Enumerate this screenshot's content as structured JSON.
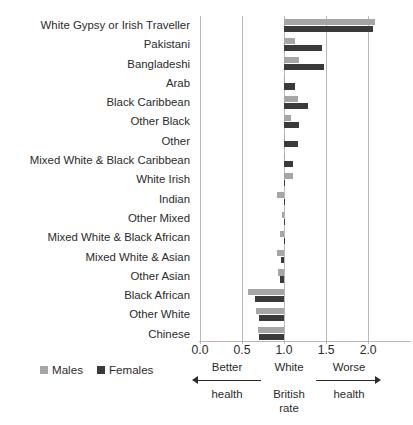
{
  "chart_data": {
    "type": "bar",
    "orientation": "horizontal",
    "title": "",
    "xlabel": "",
    "ylabel": "",
    "xlim": [
      0.0,
      2.2
    ],
    "baseline": 1.0,
    "grid": true,
    "legend_position": "bottom-left",
    "xticks": [
      "0.0",
      "0.5",
      "1.0",
      "1.5",
      "2.0"
    ],
    "xtick_values": [
      0.0,
      0.5,
      1.0,
      1.5,
      2.0
    ],
    "categories": [
      "White Gypsy or Irish Traveller",
      "Pakistani",
      "Bangladeshi",
      "Arab",
      "Black Caribbean",
      "Other Black",
      "Other",
      "Mixed White & Black Caribbean",
      "White Irish",
      "Indian",
      "Other Mixed",
      "Mixed White & Black African",
      "Mixed White & Asian",
      "Other Asian",
      "Black African",
      "Other White",
      "Chinese"
    ],
    "series": [
      {
        "name": "Males",
        "color": "#a6a6a6",
        "values": [
          2.08,
          1.13,
          1.18,
          1.0,
          1.17,
          1.08,
          1.01,
          1.0,
          1.11,
          0.92,
          0.97,
          0.95,
          0.91,
          0.93,
          0.57,
          0.67,
          0.69
        ]
      },
      {
        "name": "Females",
        "color": "#3a3a3a",
        "values": [
          2.06,
          1.45,
          1.48,
          1.13,
          1.28,
          1.18,
          1.17,
          1.11,
          1.0,
          1.0,
          1.01,
          1.0,
          0.96,
          0.95,
          0.65,
          0.7,
          0.7
        ]
      }
    ]
  },
  "legend": {
    "items": [
      {
        "label": "Males",
        "color": "#a6a6a6"
      },
      {
        "label": "Females",
        "color": "#3a3a3a"
      }
    ]
  },
  "annotation": {
    "better_line1": "Better",
    "better_line2": "health",
    "middle_line1": "White",
    "middle_line2": "British",
    "middle_line3": "rate",
    "worse_line1": "Worse",
    "worse_line2": "health"
  }
}
